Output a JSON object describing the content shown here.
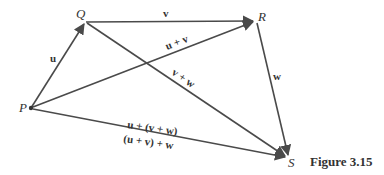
{
  "diagram": {
    "caption": "Figure 3.15",
    "points": {
      "P": {
        "label": "P",
        "x": 31,
        "y": 108
      },
      "Q": {
        "label": "Q",
        "x": 85,
        "y": 22
      },
      "R": {
        "label": "R",
        "x": 256,
        "y": 21
      },
      "S": {
        "label": "S",
        "x": 289,
        "y": 158
      }
    },
    "vectors": [
      {
        "from": "P",
        "to": "Q",
        "label": "u"
      },
      {
        "from": "Q",
        "to": "R",
        "label": "v"
      },
      {
        "from": "R",
        "to": "S",
        "label": "w"
      },
      {
        "from": "P",
        "to": "R",
        "label": "u + v"
      },
      {
        "from": "Q",
        "to": "S",
        "label": "v + w"
      },
      {
        "from": "P",
        "to": "S",
        "label": "u + (v + w)"
      }
    ],
    "extra_labels": {
      "PS_below": "(u + v) + w"
    },
    "labels": {
      "u": "u",
      "v": "v",
      "w": "w",
      "u_plus_v": "u + v",
      "v_plus_w": "v + w",
      "u_plus_v_plus_w_1": "u + (v + w)",
      "u_plus_v_plus_w_2": "(u + v) + w"
    },
    "colors": {
      "line": "#4a4a4a",
      "text": "#333333",
      "background": "#ffffff"
    }
  }
}
